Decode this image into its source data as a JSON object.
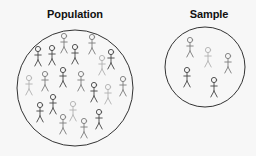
{
  "population": {
    "label": "Population",
    "circle": {
      "cx": 75,
      "cy": 88,
      "r": 58
    },
    "figures": [
      {
        "x": 38,
        "y": 49,
        "shade": "dark"
      },
      {
        "x": 52,
        "y": 48,
        "shade": "dark"
      },
      {
        "x": 64,
        "y": 36,
        "shade": "mid"
      },
      {
        "x": 75,
        "y": 47,
        "shade": "dark"
      },
      {
        "x": 92,
        "y": 37,
        "shade": "mid"
      },
      {
        "x": 111,
        "y": 52,
        "shade": "dark"
      },
      {
        "x": 102,
        "y": 58,
        "shade": "light"
      },
      {
        "x": 29,
        "y": 78,
        "shade": "light"
      },
      {
        "x": 45,
        "y": 74,
        "shade": "mid"
      },
      {
        "x": 63,
        "y": 70,
        "shade": "dark"
      },
      {
        "x": 81,
        "y": 74,
        "shade": "mid"
      },
      {
        "x": 94,
        "y": 85,
        "shade": "dark"
      },
      {
        "x": 108,
        "y": 87,
        "shade": "light"
      },
      {
        "x": 123,
        "y": 79,
        "shade": "mid"
      },
      {
        "x": 40,
        "y": 105,
        "shade": "dark"
      },
      {
        "x": 53,
        "y": 97,
        "shade": "dark"
      },
      {
        "x": 73,
        "y": 104,
        "shade": "light"
      },
      {
        "x": 63,
        "y": 117,
        "shade": "mid"
      },
      {
        "x": 84,
        "y": 121,
        "shade": "mid"
      },
      {
        "x": 99,
        "y": 112,
        "shade": "dark"
      }
    ]
  },
  "sample": {
    "label": "Sample",
    "circle": {
      "cx": 205,
      "cy": 67,
      "r": 40
    },
    "figures": [
      {
        "x": 190,
        "y": 40,
        "shade": "mid"
      },
      {
        "x": 208,
        "y": 50,
        "shade": "light"
      },
      {
        "x": 228,
        "y": 56,
        "shade": "mid"
      },
      {
        "x": 187,
        "y": 70,
        "shade": "dark"
      },
      {
        "x": 214,
        "y": 80,
        "shade": "dark"
      }
    ]
  },
  "colors": {
    "background": "#f7f7f7",
    "circle_stroke": "#333333",
    "dark": "#444444",
    "mid": "#7a7a7a",
    "light": "#b0b0b0"
  }
}
